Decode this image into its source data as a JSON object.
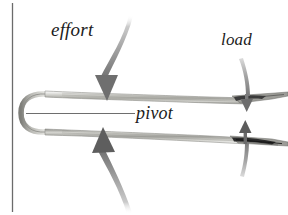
{
  "figure": {
    "background_color": "#ffffff",
    "border": {
      "left_rule_color": "#6b6b6b",
      "left_rule_x": 12
    },
    "labels": {
      "effort": "effort",
      "load": "load",
      "pivot": "pivot"
    },
    "label_style": {
      "font_style": "italic",
      "color": "#1c1c1c"
    },
    "colors": {
      "arrow_gray": "#8e8e8e",
      "arrow_dark": "#6f6f6f",
      "tool_light": "#c9c9c4",
      "tool_mid": "#9a9a95",
      "tool_dark": "#4a4a48",
      "pivot_line": "#6e6e6e",
      "tip_dark": "#2b2b2b"
    },
    "arrows": [
      {
        "name": "effort-arrow-upper",
        "label": "effort",
        "direction": "down",
        "style": "thick-curved",
        "tip_x": 106,
        "tip_y": 100
      },
      {
        "name": "effort-arrow-lower",
        "label": "effort",
        "direction": "up",
        "style": "thick-curved",
        "tip_x": 104,
        "tip_y": 131
      },
      {
        "name": "load-arrow-upper",
        "label": "load",
        "direction": "down",
        "style": "slim-straight",
        "tip_x": 247,
        "tip_y": 110
      },
      {
        "name": "load-arrow-lower",
        "label": "load",
        "direction": "up",
        "style": "slim-straight",
        "tip_x": 245,
        "tip_y": 128
      }
    ],
    "pivot_line": {
      "x1": 26,
      "y1": 114,
      "x2": 135,
      "y2": 114
    }
  }
}
